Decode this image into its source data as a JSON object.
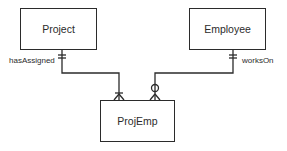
{
  "diagram": {
    "type": "er-diagram-crows-foot",
    "entities": [
      {
        "id": "project",
        "label": "Project"
      },
      {
        "id": "employee",
        "label": "Employee"
      },
      {
        "id": "projemp",
        "label": "ProjEmp"
      }
    ],
    "relationships": [
      {
        "from": "project",
        "to": "projemp",
        "label": "hasAssigned",
        "from_cardinality": "exactly-one",
        "to_cardinality": "one-or-many"
      },
      {
        "from": "employee",
        "to": "projemp",
        "label": "worksOn",
        "from_cardinality": "exactly-one",
        "to_cardinality": "zero-or-many"
      }
    ],
    "colors": {
      "line": "#2b2b2b",
      "background": "#ffffff"
    }
  }
}
